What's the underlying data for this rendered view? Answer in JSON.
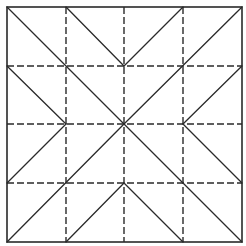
{
  "diagram": {
    "type": "fold-pattern",
    "colors": {
      "background": "#ffffff",
      "line": "#2a2a2a"
    },
    "bounds": {
      "x0": 7,
      "y0": 7,
      "x1": 242,
      "y1": 242
    },
    "grid_positions": [
      7,
      66,
      124,
      183,
      242
    ],
    "dash_pattern": "7 3",
    "outer_border": {
      "style": "solid",
      "width": 1.6
    },
    "dashed_lines": [
      {
        "x1": 66,
        "y1": 7,
        "x2": 66,
        "y2": 242
      },
      {
        "x1": 124,
        "y1": 7,
        "x2": 124,
        "y2": 242
      },
      {
        "x1": 183,
        "y1": 7,
        "x2": 183,
        "y2": 242
      },
      {
        "x1": 7,
        "y1": 66,
        "x2": 242,
        "y2": 66
      },
      {
        "x1": 7,
        "y1": 124,
        "x2": 242,
        "y2": 124
      },
      {
        "x1": 7,
        "y1": 183,
        "x2": 242,
        "y2": 183
      }
    ],
    "solid_diagonals": [
      {
        "x1": 7,
        "y1": 7,
        "x2": 124,
        "y2": 124
      },
      {
        "x1": 66,
        "y1": 7,
        "x2": 124,
        "y2": 66
      },
      {
        "x1": 7,
        "y1": 66,
        "x2": 66,
        "y2": 124
      },
      {
        "x1": 124,
        "y1": 66,
        "x2": 183,
        "y2": 7
      },
      {
        "x1": 124,
        "y1": 124,
        "x2": 242,
        "y2": 7
      },
      {
        "x1": 183,
        "y1": 124,
        "x2": 242,
        "y2": 66
      },
      {
        "x1": 7,
        "y1": 183,
        "x2": 66,
        "y2": 124
      },
      {
        "x1": 7,
        "y1": 242,
        "x2": 124,
        "y2": 124
      },
      {
        "x1": 66,
        "y1": 242,
        "x2": 124,
        "y2": 183
      },
      {
        "x1": 124,
        "y1": 124,
        "x2": 242,
        "y2": 242
      },
      {
        "x1": 124,
        "y1": 183,
        "x2": 183,
        "y2": 242
      },
      {
        "x1": 183,
        "y1": 124,
        "x2": 242,
        "y2": 183
      }
    ]
  }
}
